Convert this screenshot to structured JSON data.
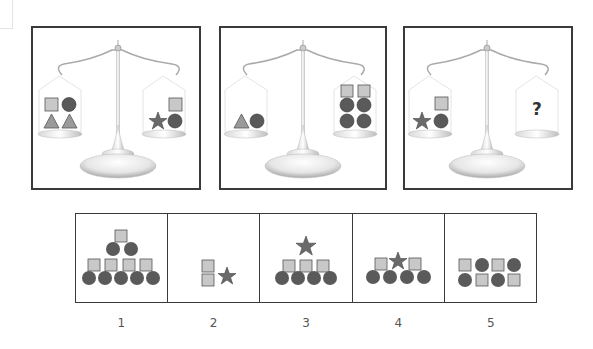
{
  "puzzle": {
    "type": "balance-scale-reasoning",
    "scales": [
      {
        "id": 1,
        "left_pan": [
          "square",
          "circle",
          "triangle",
          "triangle"
        ],
        "right_pan": [
          "square",
          "star",
          "circle"
        ]
      },
      {
        "id": 2,
        "left_pan": [
          "triangle",
          "circle"
        ],
        "right_pan": [
          "square",
          "square",
          "circle",
          "circle",
          "circle",
          "circle"
        ]
      },
      {
        "id": 3,
        "left_pan": [
          "square",
          "star",
          "circle"
        ],
        "right_pan": [
          "?"
        ]
      }
    ],
    "question_mark": "?",
    "options": [
      {
        "label": "1",
        "shapes": [
          "square",
          "circle",
          "circle",
          "square",
          "square",
          "square",
          "square",
          "circle",
          "circle",
          "circle",
          "circle",
          "circle"
        ]
      },
      {
        "label": "2",
        "shapes": [
          "square",
          "square",
          "star"
        ]
      },
      {
        "label": "3",
        "shapes": [
          "star",
          "square",
          "square",
          "square",
          "circle",
          "circle",
          "circle",
          "circle"
        ]
      },
      {
        "label": "4",
        "shapes": [
          "square",
          "star",
          "square",
          "circle",
          "circle",
          "circle",
          "circle"
        ]
      },
      {
        "label": "5",
        "shapes": [
          "square",
          "circle",
          "square",
          "circle",
          "circle",
          "square",
          "circle",
          "square"
        ]
      }
    ]
  },
  "colors": {
    "square_fill": "#c8c8c8",
    "circle_fill": "#5a5a5a",
    "triangle_fill": "#9a9a9a",
    "star_fill": "#6a6a6a",
    "border": "#3a3a3a"
  }
}
